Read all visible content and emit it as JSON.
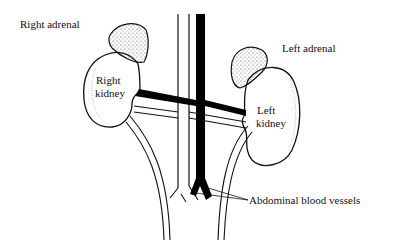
{
  "diagram": {
    "labels": {
      "right_adrenal": "Right adrenal",
      "left_adrenal": "Left adrenal",
      "right_kidney_1": "Right",
      "right_kidney_2": "kidney",
      "left_kidney_1": "Left",
      "left_kidney_2": "kidney",
      "vessels": "Abdominal blood vessels"
    },
    "colors": {
      "line": "#111111",
      "vein": "#000000",
      "background": "#ffffff"
    }
  }
}
